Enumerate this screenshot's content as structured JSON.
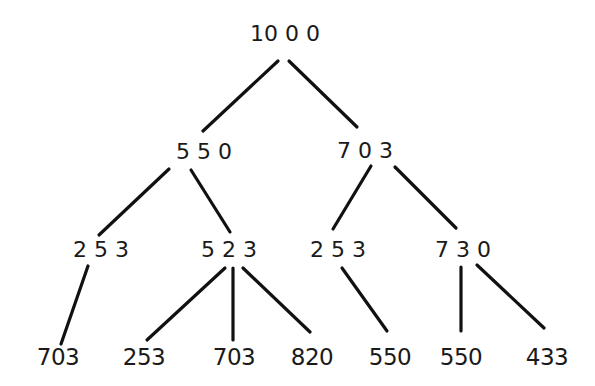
{
  "diagram": {
    "type": "tree",
    "line_color": "#111111",
    "text_color": "#1a1a1a",
    "background": "#ffffff",
    "nodes": [
      {
        "id": "n0",
        "label": "10 0 0",
        "x": 285,
        "y": 23,
        "level": 0
      },
      {
        "id": "n1",
        "label": "5 5 0",
        "x": 204,
        "y": 141,
        "level": 1
      },
      {
        "id": "n2",
        "label": "7 0 3",
        "x": 365,
        "y": 140,
        "level": 1
      },
      {
        "id": "n3",
        "label": "2 5 3",
        "x": 101,
        "y": 239,
        "level": 2
      },
      {
        "id": "n4",
        "label": "5 2 3",
        "x": 229,
        "y": 239,
        "level": 2
      },
      {
        "id": "n5",
        "label": "2 5 3",
        "x": 338,
        "y": 239,
        "level": 2
      },
      {
        "id": "n6",
        "label": "7 3 0",
        "x": 463,
        "y": 239,
        "level": 2
      },
      {
        "id": "n7",
        "label": "703",
        "x": 58,
        "y": 346,
        "level": 3
      },
      {
        "id": "n8",
        "label": "253",
        "x": 144,
        "y": 346,
        "level": 3
      },
      {
        "id": "n9",
        "label": "703",
        "x": 234,
        "y": 346,
        "level": 3
      },
      {
        "id": "n10",
        "label": "820",
        "x": 312,
        "y": 346,
        "level": 3
      },
      {
        "id": "n11",
        "label": "550",
        "x": 390,
        "y": 346,
        "level": 3
      },
      {
        "id": "n12",
        "label": "550",
        "x": 461,
        "y": 346,
        "level": 3
      },
      {
        "id": "n13",
        "label": "433",
        "x": 547,
        "y": 346,
        "level": 3
      }
    ],
    "edges": [
      {
        "from": "n0",
        "to": "n1",
        "x1": 278,
        "y1": 61,
        "x2": 203,
        "y2": 131
      },
      {
        "from": "n0",
        "to": "n2",
        "x1": 289,
        "y1": 61,
        "x2": 357,
        "y2": 127
      },
      {
        "from": "n1",
        "to": "n3",
        "x1": 169,
        "y1": 169,
        "x2": 99,
        "y2": 235
      },
      {
        "from": "n1",
        "to": "n4",
        "x1": 191,
        "y1": 170,
        "x2": 230,
        "y2": 232
      },
      {
        "from": "n2",
        "to": "n5",
        "x1": 371,
        "y1": 166,
        "x2": 333,
        "y2": 229
      },
      {
        "from": "n2",
        "to": "n6",
        "x1": 395,
        "y1": 167,
        "x2": 456,
        "y2": 228
      },
      {
        "from": "n3",
        "to": "n7",
        "x1": 88,
        "y1": 266,
        "x2": 61,
        "y2": 344
      },
      {
        "from": "n4",
        "to": "n8",
        "x1": 225,
        "y1": 268,
        "x2": 147,
        "y2": 340
      },
      {
        "from": "n4",
        "to": "n9",
        "x1": 233,
        "y1": 268,
        "x2": 233,
        "y2": 340
      },
      {
        "from": "n4",
        "to": "n10",
        "x1": 243,
        "y1": 268,
        "x2": 310,
        "y2": 332
      },
      {
        "from": "n5",
        "to": "n11",
        "x1": 342,
        "y1": 268,
        "x2": 387,
        "y2": 331
      },
      {
        "from": "n6",
        "to": "n12",
        "x1": 461,
        "y1": 267,
        "x2": 461,
        "y2": 331
      },
      {
        "from": "n6",
        "to": "n13",
        "x1": 477,
        "y1": 265,
        "x2": 544,
        "y2": 328
      }
    ]
  }
}
